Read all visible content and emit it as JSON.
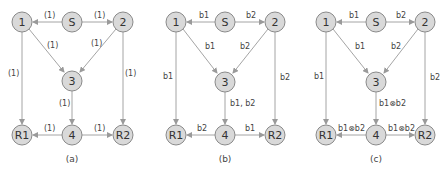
{
  "colors": {
    "node_fill": "#d9d9d9",
    "node_stroke": "#8a8a8a",
    "edge": "#9a9a9a",
    "text": "#333333"
  },
  "nodes": [
    "1",
    "S",
    "2",
    "3",
    "R1",
    "4",
    "R2"
  ],
  "panels": [
    {
      "caption": "(a)",
      "edges": {
        "S_1": "(1)",
        "S_2": "(1)",
        "1_3": "(1)",
        "2_3": "(1)",
        "1_R1": "(1)",
        "2_R2": "(1)",
        "3_4": "(1)",
        "4_R1": "(1)",
        "4_R2": "(1)"
      }
    },
    {
      "caption": "(b)",
      "edges": {
        "S_1": "b1",
        "S_2": "b2",
        "1_3": "b1",
        "2_3": "b2",
        "1_R1": "b1",
        "2_R2": "b2",
        "3_4": "b1, b2",
        "4_R1": "b2",
        "4_R2": "b1"
      }
    },
    {
      "caption": "(c)",
      "edges": {
        "S_1": "b1",
        "S_2": "b2",
        "1_3": "b1",
        "2_3": "b2",
        "1_R1": "b1",
        "2_R2": "b2",
        "3_4": "b1⊗b2",
        "4_R1": "b1⊗b2",
        "4_R2": "b1⊗b2"
      }
    }
  ]
}
